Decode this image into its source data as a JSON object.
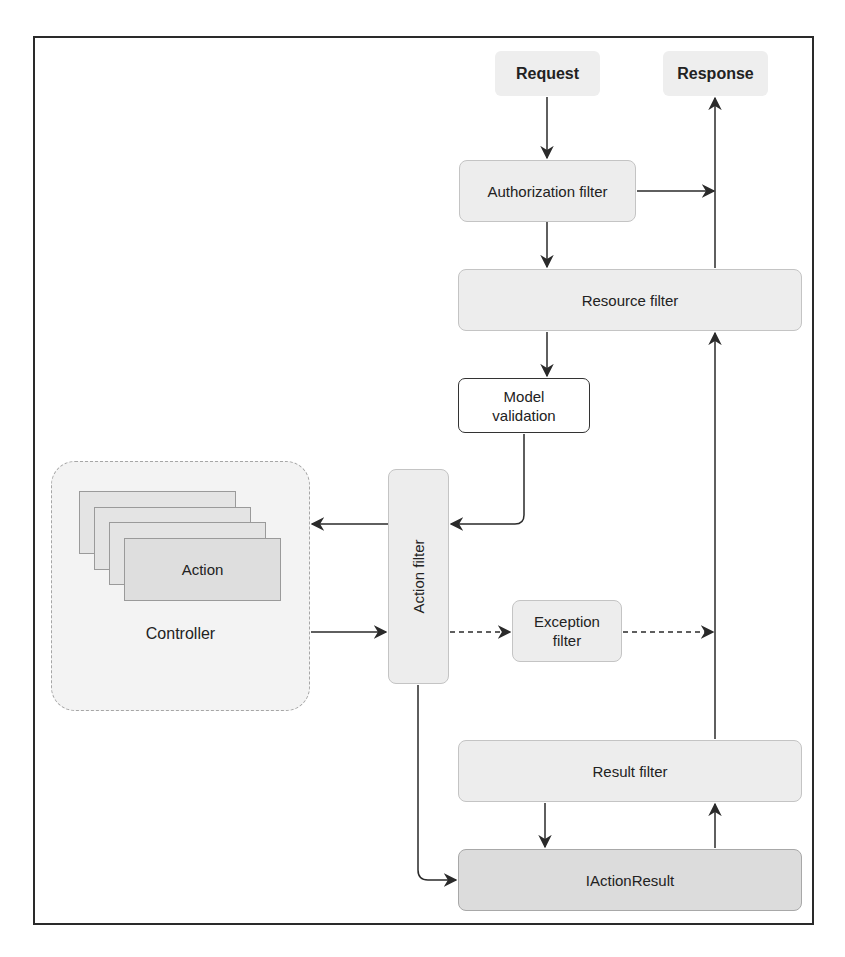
{
  "diagram": {
    "title": "",
    "nodes": {
      "request": "Request",
      "response": "Response",
      "authorization_filter": "Authorization filter",
      "resource_filter": "Resource filter",
      "model_validation_line1": "Model",
      "model_validation_line2": "validation",
      "action_filter": "Action filter",
      "exception_filter_line1": "Exception",
      "exception_filter_line2": "filter",
      "controller": "Controller",
      "action": "Action",
      "result_filter": "Result filter",
      "iactionresult": "IActionResult"
    },
    "edges": [
      {
        "from": "Request",
        "to": "Authorization filter",
        "style": "solid"
      },
      {
        "from": "Authorization filter",
        "to": "Response path",
        "style": "solid"
      },
      {
        "from": "Authorization filter",
        "to": "Resource filter",
        "style": "solid"
      },
      {
        "from": "Resource filter",
        "to": "Model validation",
        "style": "solid"
      },
      {
        "from": "Resource filter",
        "to": "Response",
        "style": "solid"
      },
      {
        "from": "Model validation",
        "to": "Action filter",
        "style": "solid"
      },
      {
        "from": "Action filter",
        "to": "Controller",
        "style": "solid"
      },
      {
        "from": "Controller",
        "to": "Action filter",
        "style": "solid"
      },
      {
        "from": "Action filter",
        "to": "Exception filter",
        "style": "dashed"
      },
      {
        "from": "Exception filter",
        "to": "Response path",
        "style": "dashed"
      },
      {
        "from": "Action filter",
        "to": "IActionResult",
        "style": "solid"
      },
      {
        "from": "Result filter",
        "to": "IActionResult",
        "style": "solid"
      },
      {
        "from": "IActionResult",
        "to": "Result filter",
        "style": "solid"
      },
      {
        "from": "Result filter",
        "to": "Resource filter",
        "style": "solid"
      }
    ],
    "colors": {
      "node_fill": "#ededed",
      "node_dark_fill": "#dcdcdc",
      "line": "#2a2a2a"
    }
  }
}
